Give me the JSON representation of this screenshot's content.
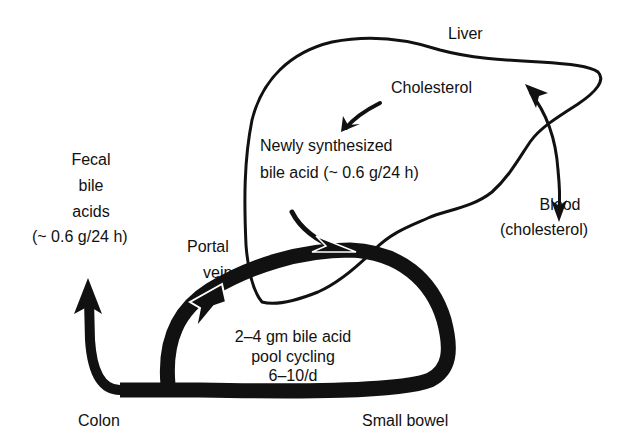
{
  "diagram": {
    "colors": {
      "ink": "#111111",
      "background": "#ffffff"
    },
    "labels": {
      "liver": "Liver",
      "cholesterol": "Cholesterol",
      "newly_line1": "Newly synthesized",
      "newly_line2": "bile acid (~ 0.6 g/24 h)",
      "fecal_line1": "Fecal",
      "fecal_line2": "bile",
      "fecal_line3": "acids",
      "fecal_line4": "(~ 0.6 g/24 h)",
      "blood_line1": "Blood",
      "blood_line2": "(cholesterol)",
      "portal_line1": "Portal",
      "portal_line2": "vein",
      "pool_line1": "2–4 gm bile acid",
      "pool_line2": "pool cycling",
      "pool_line3": "6–10/d",
      "colon": "Colon",
      "small_bowel": "Small bowel"
    },
    "nodes": [
      {
        "id": "liver",
        "label": "Liver"
      },
      {
        "id": "cholesterol",
        "label": "Cholesterol"
      },
      {
        "id": "new_bile_acid",
        "label": "Newly synthesized bile acid (~ 0.6 g/24 h)"
      },
      {
        "id": "blood",
        "label": "Blood (cholesterol)"
      },
      {
        "id": "portal_vein",
        "label": "Portal vein"
      },
      {
        "id": "small_bowel",
        "label": "Small bowel"
      },
      {
        "id": "colon",
        "label": "Colon"
      },
      {
        "id": "fecal",
        "label": "Fecal bile acids (~ 0.6 g/24 h)"
      }
    ],
    "edges": [
      {
        "from": "cholesterol",
        "to": "new_bile_acid",
        "style": "thin arrow"
      },
      {
        "from": "liver",
        "to": "blood",
        "style": "bidirectional arrow"
      },
      {
        "from": "new_bile_acid",
        "to": "small_bowel",
        "style": "joins thick loop"
      },
      {
        "from": "small_bowel",
        "to": "portal_vein",
        "style": "thick loop"
      },
      {
        "from": "portal_vein",
        "to": "liver",
        "style": "thick loop"
      },
      {
        "from": "small_bowel",
        "to": "colon",
        "style": "thick"
      },
      {
        "from": "colon",
        "to": "fecal",
        "style": "thick arrow"
      }
    ]
  }
}
